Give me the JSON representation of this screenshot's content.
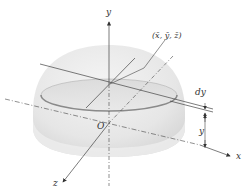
{
  "figure": {
    "type": "3d-hemisphere-centroid-diagram",
    "axes": {
      "x_label": "x",
      "y_label": "y",
      "z_label": "z",
      "origin_label": "O"
    },
    "centroid_label": "(x̄, ȳ, z̄)",
    "dimension_labels": {
      "slab_thickness": "dy",
      "slab_height": "y"
    },
    "colors": {
      "hemisphere_fill": "#ececec",
      "hemisphere_shade": "#d9d9d9",
      "disk_rim": "#8a8a8a",
      "axis_line": "#444444",
      "background": "#ffffff"
    }
  }
}
